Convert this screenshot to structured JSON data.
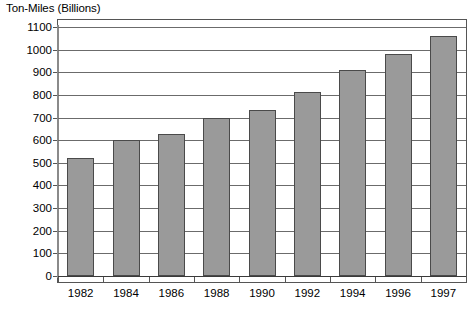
{
  "chart_data": {
    "type": "bar",
    "title": "Ton-Miles (Billions)",
    "xlabel": "",
    "ylabel": "Ton-Miles (Billions)",
    "categories": [
      "1982",
      "1984",
      "1986",
      "1988",
      "1990",
      "1992",
      "1994",
      "1996",
      "1997"
    ],
    "values": [
      520,
      600,
      628,
      700,
      733,
      815,
      910,
      980,
      1060
    ],
    "ylim": [
      0,
      1100
    ],
    "ytick_step": 100,
    "yticks": [
      0,
      100,
      200,
      300,
      400,
      500,
      600,
      700,
      800,
      900,
      1000,
      1100
    ],
    "ytick_labels": [
      "0",
      "100",
      "200",
      "300",
      "400",
      "500",
      "600",
      "700",
      "800",
      "900",
      "1000",
      "1100"
    ],
    "grid": true,
    "grid_axis": "y",
    "legend": false,
    "legend_position": "none",
    "bar_color": "#9a9a9a",
    "bar_edge_color": "#4a4a4a",
    "grid_color": "#6b6b6b",
    "background_color": "#ffffff",
    "text_color": "#000000"
  }
}
